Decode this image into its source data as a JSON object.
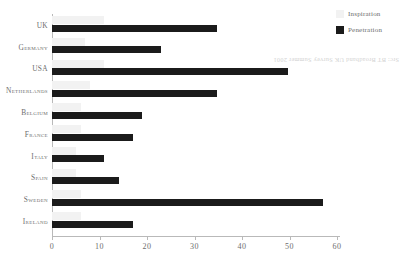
{
  "chart_data": {
    "type": "bar",
    "orientation": "horizontal",
    "title": "",
    "xlabel": "",
    "ylabel": "",
    "xlim": [
      0,
      60
    ],
    "grid": false,
    "legend_position": "top-right",
    "categories": [
      "UK",
      "Germany",
      "USA",
      "Netherlands",
      "Belgium",
      "France",
      "Italy",
      "Spain",
      "Sweden",
      "Ireland"
    ],
    "xticks": [
      0,
      10,
      20,
      30,
      40,
      50,
      60
    ],
    "series": [
      {
        "name": "Inspiration",
        "color": "#f2f2f2",
        "values": [
          11,
          7,
          11,
          8,
          6,
          6,
          5,
          5,
          6,
          6
        ]
      },
      {
        "name": "Penetration",
        "color": "#1b1b1b",
        "values": [
          34.7,
          23,
          49.7,
          34.7,
          19,
          17,
          11,
          14,
          57,
          17
        ]
      }
    ]
  },
  "legend": {
    "items": [
      {
        "label": "Inspiration",
        "swatch": "light-swatch-icon"
      },
      {
        "label": "Penetration",
        "swatch": "dark-swatch-icon"
      }
    ]
  },
  "source": {
    "note": "Src: BT Broadband UK Survey Summer 2001"
  }
}
